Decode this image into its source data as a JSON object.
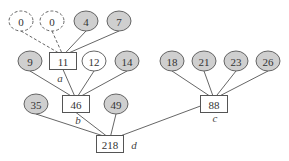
{
  "diagram": {
    "type": "tree",
    "colors": {
      "leaf_fill": "#cfcfcf",
      "leaf_stroke": "#555555",
      "empty_fill": "#ffffff",
      "edge": "#555555",
      "box_stroke": "#555555"
    },
    "nodes": [
      {
        "id": "z1",
        "value": "0",
        "shape": "ellipse",
        "style": "dashed",
        "x": 21,
        "y": 21
      },
      {
        "id": "z2",
        "value": "0",
        "shape": "ellipse",
        "style": "dashed",
        "x": 52,
        "y": 21
      },
      {
        "id": "n4",
        "value": "4",
        "shape": "ellipse",
        "style": "filled",
        "x": 86,
        "y": 21
      },
      {
        "id": "n7",
        "value": "7",
        "shape": "ellipse",
        "style": "filled",
        "x": 119,
        "y": 21
      },
      {
        "id": "n9",
        "value": "9",
        "shape": "ellipse",
        "style": "filled",
        "x": 30,
        "y": 61
      },
      {
        "id": "a",
        "value": "11",
        "shape": "box",
        "x": 63,
        "y": 61,
        "tag": "a"
      },
      {
        "id": "n12",
        "value": "12",
        "shape": "ellipse",
        "style": "white",
        "x": 94,
        "y": 61
      },
      {
        "id": "n14",
        "value": "14",
        "shape": "ellipse",
        "style": "filled",
        "x": 127,
        "y": 61
      },
      {
        "id": "n18",
        "value": "18",
        "shape": "ellipse",
        "style": "filled",
        "x": 172,
        "y": 61
      },
      {
        "id": "n21",
        "value": "21",
        "shape": "ellipse",
        "style": "filled",
        "x": 204,
        "y": 61
      },
      {
        "id": "n23",
        "value": "23",
        "shape": "ellipse",
        "style": "filled",
        "x": 236,
        "y": 61
      },
      {
        "id": "n26",
        "value": "26",
        "shape": "ellipse",
        "style": "filled",
        "x": 268,
        "y": 61
      },
      {
        "id": "n35",
        "value": "35",
        "shape": "ellipse",
        "style": "filled",
        "x": 36,
        "y": 104
      },
      {
        "id": "b",
        "value": "46",
        "shape": "box",
        "x": 76,
        "y": 104,
        "tag": "b"
      },
      {
        "id": "n49",
        "value": "49",
        "shape": "ellipse",
        "style": "filled",
        "x": 116,
        "y": 104
      },
      {
        "id": "c",
        "value": "88",
        "shape": "box",
        "x": 214,
        "y": 104,
        "tag": "c"
      },
      {
        "id": "d",
        "value": "218",
        "shape": "box",
        "x": 110,
        "y": 144,
        "tag": "d"
      }
    ],
    "tags": [
      {
        "label": "a",
        "x": 60,
        "y": 78
      },
      {
        "label": "b",
        "x": 78,
        "y": 120
      },
      {
        "label": "c",
        "x": 215,
        "y": 118
      },
      {
        "label": "d",
        "x": 134,
        "y": 145
      }
    ],
    "edges": [
      {
        "from": "z1",
        "to": "a",
        "style": "dashed"
      },
      {
        "from": "z2",
        "to": "a",
        "style": "dashed"
      },
      {
        "from": "n4",
        "to": "a"
      },
      {
        "from": "n7",
        "to": "a"
      },
      {
        "from": "n9",
        "to": "b"
      },
      {
        "from": "a",
        "to": "b"
      },
      {
        "from": "n12",
        "to": "b"
      },
      {
        "from": "n14",
        "to": "b"
      },
      {
        "from": "n18",
        "to": "c"
      },
      {
        "from": "n21",
        "to": "c"
      },
      {
        "from": "n23",
        "to": "c"
      },
      {
        "from": "n26",
        "to": "c"
      },
      {
        "from": "n35",
        "to": "d"
      },
      {
        "from": "b",
        "to": "d"
      },
      {
        "from": "n49",
        "to": "d"
      },
      {
        "from": "c",
        "to": "d"
      }
    ]
  }
}
